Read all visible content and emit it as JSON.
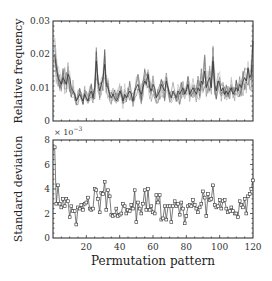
{
  "chart_data": [
    {
      "type": "line",
      "title": "",
      "xlabel": "",
      "ylabel": "Relative frequency",
      "xlim": [
        1,
        120
      ],
      "ylim": [
        0,
        0.03
      ],
      "yticks": [
        "0",
        "0.01",
        "0.02",
        "0.03"
      ],
      "grid": false,
      "description": "Many overlapping gray lines (one per sample) of relative frequency per permutation pattern",
      "series": [
        {
          "name": "mean relative frequency (approx.)",
          "x": [
            1,
            2,
            3,
            4,
            5,
            6,
            7,
            8,
            9,
            10,
            11,
            12,
            13,
            14,
            15,
            16,
            17,
            18,
            19,
            20,
            21,
            22,
            23,
            24,
            25,
            26,
            27,
            28,
            29,
            30,
            31,
            32,
            33,
            34,
            35,
            36,
            37,
            38,
            39,
            40,
            41,
            42,
            43,
            44,
            45,
            46,
            47,
            48,
            49,
            50,
            51,
            52,
            53,
            54,
            55,
            56,
            57,
            58,
            59,
            60,
            61,
            62,
            63,
            64,
            65,
            66,
            67,
            68,
            69,
            70,
            71,
            72,
            73,
            74,
            75,
            76,
            77,
            78,
            79,
            80,
            81,
            82,
            83,
            84,
            85,
            86,
            87,
            88,
            89,
            90,
            91,
            92,
            93,
            94,
            95,
            96,
            97,
            98,
            99,
            100,
            101,
            102,
            103,
            104,
            105,
            106,
            107,
            108,
            109,
            110,
            111,
            112,
            113,
            114,
            115,
            116,
            117,
            118,
            119,
            120
          ],
          "values": [
            0.02,
            0.016,
            0.013,
            0.012,
            0.011,
            0.013,
            0.012,
            0.011,
            0.014,
            0.013,
            0.01,
            0.009,
            0.008,
            0.006,
            0.007,
            0.008,
            0.007,
            0.006,
            0.008,
            0.007,
            0.006,
            0.008,
            0.009,
            0.007,
            0.01,
            0.018,
            0.012,
            0.009,
            0.011,
            0.013,
            0.017,
            0.011,
            0.01,
            0.008,
            0.007,
            0.008,
            0.007,
            0.006,
            0.007,
            0.009,
            0.008,
            0.006,
            0.008,
            0.007,
            0.008,
            0.009,
            0.008,
            0.006,
            0.009,
            0.01,
            0.011,
            0.009,
            0.008,
            0.01,
            0.012,
            0.011,
            0.014,
            0.01,
            0.009,
            0.011,
            0.01,
            0.007,
            0.008,
            0.009,
            0.011,
            0.01,
            0.009,
            0.012,
            0.01,
            0.008,
            0.007,
            0.009,
            0.008,
            0.007,
            0.009,
            0.008,
            0.009,
            0.01,
            0.008,
            0.009,
            0.011,
            0.008,
            0.009,
            0.01,
            0.009,
            0.008,
            0.01,
            0.009,
            0.012,
            0.011,
            0.015,
            0.01,
            0.012,
            0.013,
            0.01,
            0.018,
            0.011,
            0.009,
            0.012,
            0.011,
            0.009,
            0.01,
            0.008,
            0.009,
            0.008,
            0.009,
            0.01,
            0.008,
            0.009,
            0.01,
            0.009,
            0.011,
            0.01,
            0.012,
            0.013,
            0.012,
            0.016,
            0.013,
            0.014,
            0.024
          ]
        }
      ]
    },
    {
      "type": "line",
      "title": "",
      "xlabel": "Permutation pattern",
      "ylabel": "Standard deviation",
      "y_multiplier": "× 10^-3",
      "xlim": [
        1,
        120
      ],
      "ylim": [
        0,
        8
      ],
      "xticks": [
        "20",
        "40",
        "60",
        "80",
        "100",
        "120"
      ],
      "yticks": [
        "0",
        "2",
        "4",
        "6",
        "8"
      ],
      "grid": false,
      "marker": "square",
      "series": [
        {
          "name": "standard deviation (×10^-3)",
          "x": [
            1,
            2,
            3,
            4,
            5,
            6,
            7,
            8,
            9,
            10,
            11,
            12,
            13,
            14,
            15,
            16,
            17,
            18,
            19,
            20,
            21,
            22,
            23,
            24,
            25,
            26,
            27,
            28,
            29,
            30,
            31,
            32,
            33,
            34,
            35,
            36,
            37,
            38,
            39,
            40,
            41,
            42,
            43,
            44,
            45,
            46,
            47,
            48,
            49,
            50,
            51,
            52,
            53,
            54,
            55,
            56,
            57,
            58,
            59,
            60,
            61,
            62,
            63,
            64,
            65,
            66,
            67,
            68,
            69,
            70,
            71,
            72,
            73,
            74,
            75,
            76,
            77,
            78,
            79,
            80,
            81,
            82,
            83,
            84,
            85,
            86,
            87,
            88,
            89,
            90,
            91,
            92,
            93,
            94,
            95,
            96,
            97,
            98,
            99,
            100,
            101,
            102,
            103,
            104,
            105,
            106,
            107,
            108,
            109,
            110,
            111,
            112,
            113,
            114,
            115,
            116,
            117,
            118,
            119,
            120
          ],
          "values": [
            7.4,
            2.8,
            4.3,
            2.8,
            2.5,
            3.2,
            2.6,
            3.2,
            3.0,
            1.7,
            2.6,
            2.2,
            2.2,
            1.1,
            2.5,
            2.4,
            2.7,
            2.3,
            2.8,
            2.9,
            3.3,
            2.4,
            2.3,
            2.4,
            4.0,
            3.9,
            3.2,
            2.1,
            3.7,
            3.6,
            4.6,
            2.3,
            3.9,
            3.4,
            1.9,
            1.8,
            1.9,
            2.4,
            1.8,
            1.9,
            2.0,
            2.8,
            2.6,
            2.0,
            2.3,
            2.2,
            2.7,
            2.4,
            3.9,
            1.3,
            2.9,
            2.4,
            2.0,
            2.8,
            3.9,
            2.3,
            4.0,
            2.3,
            2.6,
            2.1,
            2.0,
            3.5,
            2.9,
            3.5,
            1.5,
            1.6,
            2.6,
            1.5,
            2.6,
            2.6,
            1.3,
            2.6,
            3.0,
            2.6,
            2.8,
            1.9,
            2.9,
            2.4,
            1.2,
            1.8,
            2.6,
            2.7,
            2.6,
            3.1,
            2.7,
            2.4,
            2.1,
            2.5,
            2.8,
            3.8,
            3.3,
            1.8,
            3.6,
            3.1,
            3.2,
            4.3,
            2.7,
            2.5,
            2.6,
            3.1,
            2.4,
            3.0,
            3.1,
            2.4,
            2.1,
            2.2,
            2.5,
            2.2,
            2.0,
            2.0,
            1.7,
            3.0,
            2.7,
            2.5,
            3.2,
            2.0,
            3.4,
            3.6,
            4.0,
            4.7
          ]
        }
      ]
    }
  ],
  "labels": {
    "top_ylabel": "Relative frequency",
    "bottom_ylabel": "Standard deviation",
    "xlabel": "Permutation pattern",
    "multiplier_base": "× 10",
    "multiplier_exp": "−3"
  }
}
